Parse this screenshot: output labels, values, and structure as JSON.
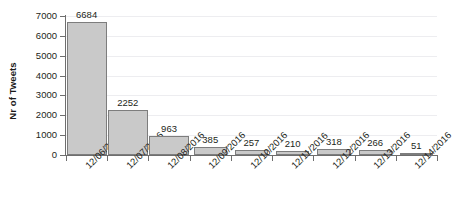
{
  "chart_data": {
    "type": "bar",
    "title": "",
    "xlabel": "",
    "ylabel": "Nr of Tweets",
    "categories": [
      "12/06/2016",
      "12/07/2016",
      "12/08/2016",
      "12/09/2016",
      "12/10/2016",
      "12/11/2016",
      "12/12/2016",
      "12/13/2016",
      "12/14/2016"
    ],
    "values": [
      6684,
      2252,
      963,
      385,
      257,
      210,
      318,
      266,
      51
    ],
    "value_labels": [
      "6684",
      "2252",
      "963",
      "385",
      "257",
      "210",
      "318",
      "266",
      "51"
    ],
    "ylim": [
      0,
      7000
    ],
    "ytick_labels": [
      "0",
      "1000",
      "2000",
      "3000",
      "4000",
      "5000",
      "6000",
      "7000"
    ],
    "ytick_values": [
      0,
      1000,
      2000,
      3000,
      4000,
      5000,
      6000,
      7000
    ],
    "grid": true,
    "legend": false,
    "bar_fill_color": "#c9c9c9",
    "bar_border_color": "#7d7d7d",
    "axis_color": "#6e6e6e",
    "gridline_color": "#ededf0",
    "text_color": "#231f20",
    "background_color": "#ffffff"
  }
}
